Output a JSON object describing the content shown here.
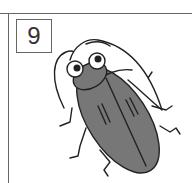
{
  "card": {
    "number": "9"
  },
  "illustration": {
    "subject": "cockroach-icon",
    "body_color": "#777777",
    "outline_color": "#222222"
  }
}
